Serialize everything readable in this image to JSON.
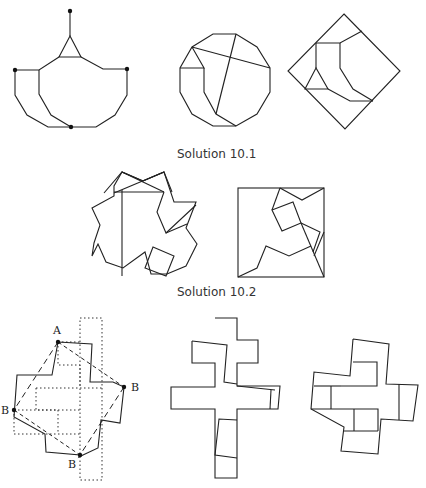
{
  "captions": {
    "solution_1": "Solution 10.1",
    "solution_2": "Solution 10.2",
    "solution_3_cropped": ""
  },
  "point_labels": {
    "a": "A",
    "b_left": "B",
    "b_right": "B",
    "b_bottom": "B"
  },
  "figures": [
    {
      "id": "fig-10-1-hanging-polygon",
      "description": "dodecagon half with triangle and hanging point"
    },
    {
      "id": "fig-10-1-dodecagon",
      "description": "dissected dodecagon"
    },
    {
      "id": "fig-10-1-square",
      "description": "dissected square (rotated 45°)"
    },
    {
      "id": "fig-10-2-star",
      "description": "eight-pointed star dissection"
    },
    {
      "id": "fig-10-2-square",
      "description": "square dissection"
    },
    {
      "id": "fig-10-3-overlay",
      "description": "cross overlay with dotted and dashed lines, points A and B"
    },
    {
      "id": "fig-10-3-cross",
      "description": "cross dissection"
    },
    {
      "id": "fig-10-3-cross-alt",
      "description": "alternate cross dissection"
    }
  ]
}
